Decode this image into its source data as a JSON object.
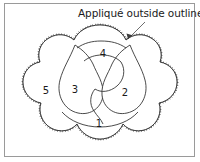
{
  "document": {
    "type": "appliqué pattern diagram",
    "caption": "Appliqué outside outline."
  },
  "frame": {
    "border_color": "#9a9a9a",
    "background": "#ffffff"
  },
  "annotation": {
    "leader_label": "leader-line-to-outline",
    "arrow_label": "arrowhead"
  },
  "pattern": {
    "outline_color": "#2b2b2b",
    "stitch_color": "#3a3a3a",
    "fill": "#ffffff",
    "regions": [
      {
        "id": "region-1",
        "number": "1",
        "x": 99,
        "y": 124,
        "desc": "bottom lobe"
      },
      {
        "id": "region-2",
        "number": "2",
        "x": 125,
        "y": 93,
        "desc": "right petal"
      },
      {
        "id": "region-3",
        "number": "3",
        "x": 75,
        "y": 90,
        "desc": "left petal"
      },
      {
        "id": "region-4",
        "number": "4",
        "x": 103,
        "y": 54,
        "desc": "top petal"
      },
      {
        "id": "region-5",
        "number": "5",
        "x": 46,
        "y": 91,
        "desc": "scalloped background"
      }
    ]
  }
}
